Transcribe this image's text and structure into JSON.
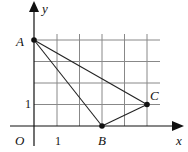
{
  "diagram": {
    "type": "coordinate-grid-triangle",
    "axes": {
      "x_label": "x",
      "y_label": "y",
      "origin_label": "O",
      "unit_x_label": "1",
      "unit_y_label": "1"
    },
    "grid": {
      "x_range": [
        0,
        5
      ],
      "y_range": [
        0,
        4
      ]
    },
    "points": [
      {
        "name": "A",
        "x": 0,
        "y": 4
      },
      {
        "name": "B",
        "x": 3,
        "y": 0
      },
      {
        "name": "C",
        "x": 5,
        "y": 1
      }
    ],
    "segments": [
      [
        "A",
        "B"
      ],
      [
        "B",
        "C"
      ],
      [
        "C",
        "A"
      ]
    ],
    "colors": {
      "grid": "#888888",
      "lines": "#111111"
    }
  }
}
